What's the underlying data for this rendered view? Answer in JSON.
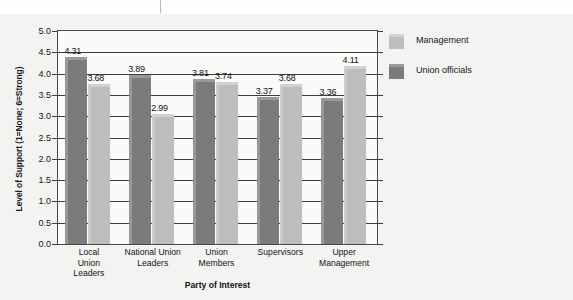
{
  "chart_data": {
    "type": "bar",
    "title": "",
    "xlabel": "Party of Interest",
    "ylabel": "Level of Support (1=None; 6=Strong)",
    "categories": [
      "Local Union Leaders",
      "National Union Leaders",
      "Union Members",
      "Supervisors",
      "Upper Management"
    ],
    "category_lines": [
      [
        "Local",
        "Union",
        "Leaders"
      ],
      [
        "National Union",
        "Leaders"
      ],
      [
        "Union",
        "Members"
      ],
      [
        "Supervisors"
      ],
      [
        "Upper",
        "Management"
      ]
    ],
    "series": [
      {
        "name": "Union officials",
        "color": "#7b7b7b",
        "values": [
          4.31,
          3.89,
          3.81,
          3.37,
          3.36
        ]
      },
      {
        "name": "Management",
        "color": "#bdbdbd",
        "values": [
          3.68,
          2.99,
          3.74,
          3.68,
          4.11
        ]
      }
    ],
    "value_labels": {
      "union_officials": [
        "4.31",
        "3.89",
        "3.81",
        "3.37",
        "3.36"
      ],
      "management": [
        "3.68",
        "2.99",
        "3.74",
        "3.68",
        "4.11"
      ]
    },
    "ylim": [
      0.0,
      5.0
    ],
    "ytick_labels": [
      "5.0",
      "4.5",
      "4.0",
      "3.5",
      "3.0",
      "2.5",
      "2.0",
      "1.5",
      "1.0",
      "0.5",
      "0.0"
    ],
    "ytick_values": [
      5.0,
      4.5,
      4.0,
      3.5,
      3.0,
      2.5,
      2.0,
      1.5,
      1.0,
      0.5,
      0.0
    ],
    "grid": true,
    "legend_position": "right",
    "legend": [
      {
        "label": "Management",
        "color": "#bdbdbd"
      },
      {
        "label": "Union officials",
        "color": "#7b7b7b"
      }
    ]
  }
}
